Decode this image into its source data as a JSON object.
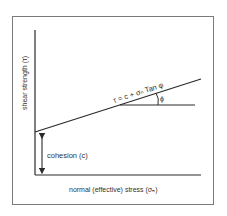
{
  "diagram": {
    "y_axis_label": "shear strength (τ)",
    "x_axis_label": "normal (effective) stress (σₙ)",
    "equation": "τ = c + σₙ Tan φ",
    "angle_label": "ϕ",
    "cohesion_label": "cohesion (c)",
    "colors": {
      "line": "#2a2a2a",
      "frame": "#7a7a7a",
      "background": "#ffffff"
    }
  }
}
